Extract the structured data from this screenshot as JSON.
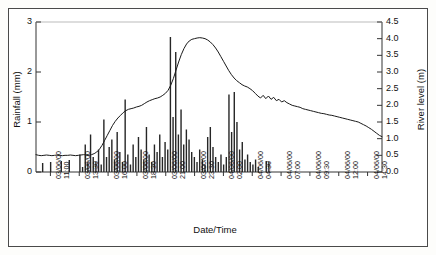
{
  "chart_data": {
    "type": "bar",
    "title": "",
    "subtitle": "",
    "xlabel": "Date/Time",
    "grid": false,
    "legend_position": "none",
    "axes": {
      "left": {
        "label": "Rainfall (mm)",
        "ticks": [
          "0",
          "1",
          "2",
          "3"
        ],
        "tick_values": [
          0,
          1,
          2,
          3
        ],
        "range": [
          0,
          3
        ],
        "units": "mm"
      },
      "right": {
        "label": "River level (m)",
        "ticks": [
          "0.0",
          "0.5",
          "1.0",
          "1.5",
          "2.0",
          "2.5",
          "3.0",
          "3.5",
          "4.0",
          "4.5"
        ],
        "tick_values": [
          0.0,
          0.5,
          1.0,
          1.5,
          2.0,
          2.5,
          3.0,
          3.5,
          4.0,
          4.5
        ],
        "range": [
          0,
          4.5
        ],
        "units": "m"
      },
      "x": {
        "label": "Date/Time",
        "tick_labels": [
          {
            "date": "03/06/00",
            "time": "11:00"
          },
          {
            "date": "03/06/00",
            "time": "13:30"
          },
          {
            "date": "03/06/00",
            "time": "16:00"
          },
          {
            "date": "03/06/00",
            "time": "18:30"
          },
          {
            "date": "03/06/00",
            "time": "21:00"
          },
          {
            "date": "03/06/00",
            "time": "23:30"
          },
          {
            "date": "04/06/00",
            "time": "02:00"
          },
          {
            "date": "04/06/00",
            "time": "04:30"
          },
          {
            "date": "04/06/00",
            "time": "07:00"
          },
          {
            "date": "04/06/00",
            "time": "09:30"
          },
          {
            "date": "04/06/00",
            "time": "12:00"
          },
          {
            "date": "04/06/00",
            "time": "14:30"
          }
        ],
        "interval_hours": 2.5,
        "start": "03/06/00 10:00",
        "end": "04/06/00 15:30"
      }
    },
    "series": [
      {
        "name": "Rainfall",
        "type": "bar",
        "axis": "left",
        "color": "#262626",
        "values": [
          0.0,
          0.0,
          0.18,
          0.0,
          0.0,
          0.2,
          0.0,
          0.0,
          0.0,
          0.22,
          0.0,
          0.0,
          0.24,
          0.0,
          0.0,
          0.0,
          0.35,
          0.1,
          0.55,
          0.2,
          0.75,
          0.3,
          0.2,
          0.45,
          0.15,
          1.05,
          0.3,
          0.5,
          0.65,
          0.25,
          0.8,
          0.4,
          0.2,
          1.45,
          0.35,
          0.15,
          0.55,
          0.3,
          0.7,
          0.45,
          0.25,
          0.9,
          0.35,
          0.2,
          0.55,
          0.4,
          0.75,
          0.3,
          0.6,
          0.45,
          2.7,
          1.1,
          2.4,
          0.75,
          1.25,
          0.55,
          0.85,
          0.65,
          0.4,
          0.3,
          0.2,
          0.45,
          0.25,
          0.15,
          0.7,
          0.9,
          0.5,
          0.3,
          0.2,
          0.35,
          0.15,
          0.3,
          1.55,
          0.8,
          1.6,
          1.0,
          0.45,
          0.6,
          0.25,
          0.35,
          0.2,
          0.15,
          0.25,
          0.1,
          0.0,
          0.0,
          0.22,
          0.2,
          0.0,
          0.0,
          0.0,
          0.0,
          0.0,
          0.0,
          0.0,
          0.0,
          0.0,
          0.0,
          0.0,
          0.0,
          0.0,
          0.0,
          0.0,
          0.0,
          0.0,
          0.0,
          0.0,
          0.0,
          0.0,
          0.0,
          0.0,
          0.0,
          0.0,
          0.0,
          0.0,
          0.0,
          0.0,
          0.0,
          0.0,
          0.0,
          0.0,
          0.0,
          0.0,
          0.0,
          0.0,
          0.0,
          0.0,
          0.0,
          0.0,
          0.0
        ],
        "max_value": 2.7,
        "max_label": "2.7"
      },
      {
        "name": "River level",
        "type": "line",
        "axis": "right",
        "color": "#1a1a1a",
        "values": [
          0.52,
          0.5,
          0.49,
          0.5,
          0.51,
          0.5,
          0.49,
          0.5,
          0.51,
          0.5,
          0.49,
          0.5,
          0.5,
          0.51,
          0.5,
          0.49,
          0.5,
          0.51,
          0.52,
          0.51,
          0.5,
          0.52,
          0.55,
          0.6,
          0.68,
          0.8,
          0.95,
          1.1,
          1.25,
          1.4,
          1.52,
          1.62,
          1.7,
          1.78,
          1.84,
          1.88,
          1.9,
          1.92,
          1.95,
          1.97,
          2.0,
          2.05,
          2.1,
          2.14,
          2.17,
          2.2,
          2.22,
          2.25,
          2.3,
          2.36,
          2.45,
          2.6,
          2.8,
          3.05,
          3.3,
          3.52,
          3.7,
          3.84,
          3.93,
          3.98,
          4.0,
          4.02,
          4.03,
          4.02,
          4.0,
          3.96,
          3.9,
          3.82,
          3.72,
          3.6,
          3.46,
          3.32,
          3.18,
          3.04,
          2.92,
          2.82,
          2.74,
          2.68,
          2.62,
          2.58,
          2.55,
          2.5,
          2.44,
          2.36,
          2.28,
          2.22,
          2.3,
          2.2,
          2.28,
          2.18,
          2.24,
          2.14,
          2.18,
          2.1,
          2.14,
          2.08,
          2.04,
          2.0,
          1.98,
          1.96,
          1.94,
          1.9,
          1.88,
          1.86,
          1.84,
          1.82,
          1.8,
          1.78,
          1.76,
          1.75,
          1.73,
          1.71,
          1.7,
          1.68,
          1.66,
          1.64,
          1.62,
          1.6,
          1.58,
          1.56,
          1.54,
          1.52,
          1.5,
          1.46,
          1.42,
          1.38,
          1.33,
          1.28,
          1.22,
          1.16,
          1.1,
          1.06
        ],
        "peak_value": 4.03,
        "baseline_value": 0.5,
        "end_value": 1.06
      }
    ]
  }
}
